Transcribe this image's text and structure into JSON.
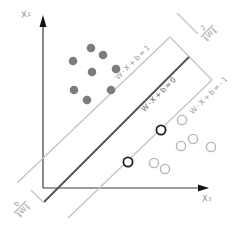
{
  "diagram": {
    "type": "svm-margin-illustration",
    "axes": {
      "x_label": "X₁",
      "y_label": "X₂"
    },
    "lines": {
      "margin_plus_label": "W·X+b=1",
      "hyperplane_label": "W·X+b=0",
      "margin_minus_label": "W·X+b=-1"
    },
    "annotations": {
      "margin_width": {
        "numerator": "2",
        "denominator": "‖W‖"
      },
      "bias_offset": {
        "numerator": "b",
        "denominator": "‖W‖"
      }
    }
  },
  "points": {
    "positive_filled": [
      [
        91,
        48
      ],
      [
        103,
        55
      ],
      [
        73,
        61
      ],
      [
        116,
        69
      ],
      [
        92,
        72
      ],
      [
        74,
        90
      ],
      [
        87,
        100
      ],
      [
        111,
        90
      ]
    ],
    "negative_hollow": [
      [
        182,
        120
      ],
      [
        193,
        139
      ],
      [
        181,
        146
      ],
      [
        211,
        147
      ],
      [
        154,
        163
      ],
      [
        165,
        169
      ]
    ],
    "support_vectors": [
      [
        161,
        130
      ],
      [
        128,
        162
      ]
    ]
  },
  "point_styles": {
    "positive_filled": {
      "fill": "#7d7d7d",
      "stroke": "none",
      "stroke_width": 0,
      "radius": 4.3
    },
    "negative_hollow": {
      "fill": "#ffffff",
      "stroke": "#b5b5b5",
      "stroke_width": 1.4,
      "radius": 4.6
    },
    "support_vectors": {
      "fill": "#ffffff",
      "stroke": "#1f1f1f",
      "stroke_width": 1.8,
      "radius": 4.6
    }
  },
  "colors": {
    "hyperplane": "#4f4f4f",
    "margin_line": "#c4c4c4",
    "axis": "#3a3a3a",
    "arrow": "#141414"
  }
}
